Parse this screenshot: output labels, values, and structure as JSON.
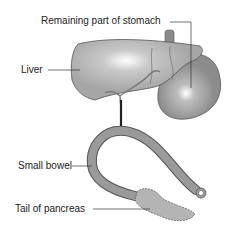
{
  "labels": {
    "stomach": "Remaining part of stomach",
    "liver": "Liver",
    "bowel": "Small bowel",
    "pancreas": "Tail of pancreas"
  },
  "colors": {
    "organ_fill": "#a9a9a9",
    "organ_dark": "#8f8f8f",
    "outline": "#555555",
    "pancreas": "#b4b4b4"
  }
}
